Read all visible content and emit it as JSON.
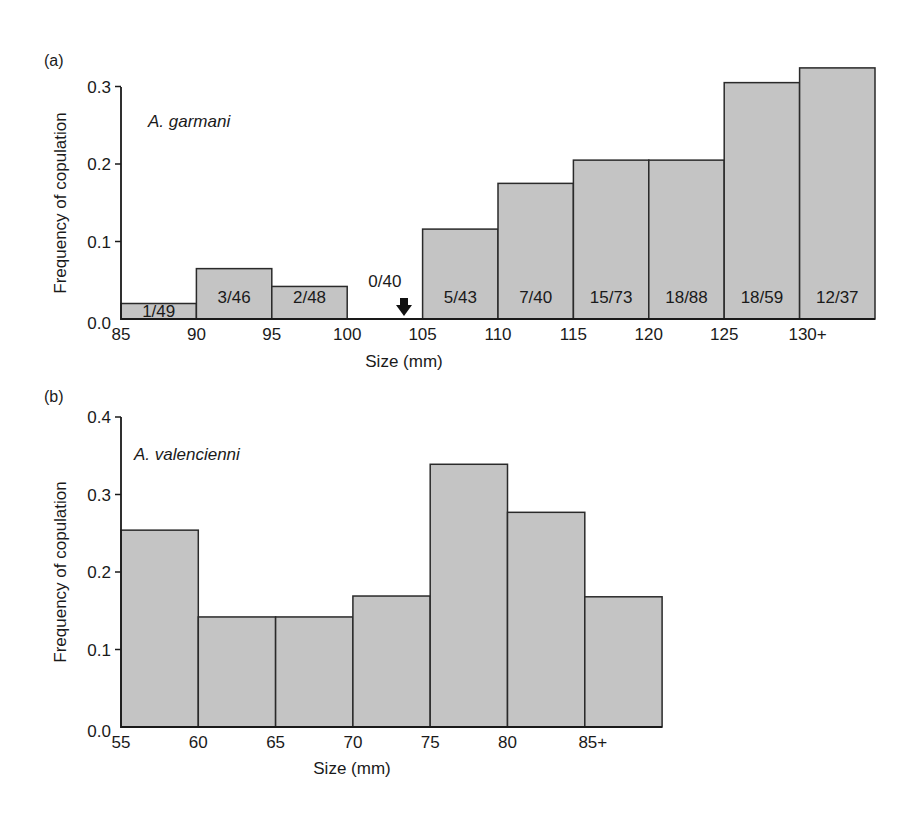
{
  "chart_data": [
    {
      "type": "bar",
      "panel": "(a)",
      "title": "A. garmani",
      "xlabel": "Size (mm)",
      "ylabel": "Frequency of copulation",
      "ylim": [
        0,
        0.3
      ],
      "yticks": [
        "0.0",
        "0.1",
        "0.2",
        "0.3"
      ],
      "categories": [
        "85",
        "90",
        "95",
        "100",
        "105",
        "110",
        "115",
        "120",
        "125",
        "130+"
      ],
      "values": [
        0.02,
        0.065,
        0.042,
        0.0,
        0.116,
        0.175,
        0.205,
        0.205,
        0.305,
        0.324
      ],
      "bar_labels": [
        "1/49",
        "3/46",
        "2/48",
        "0/40",
        "5/43",
        "7/40",
        "15/73",
        "18/88",
        "18/59",
        "12/37"
      ],
      "annotation": "arrow marking zero-height bin 100–105 (0/40)",
      "grid": false,
      "legend": null
    },
    {
      "type": "bar",
      "panel": "(b)",
      "title": "A. valencienni",
      "xlabel": "Size (mm)",
      "ylabel": "Frequency of copulation",
      "ylim": [
        0,
        0.4
      ],
      "yticks": [
        "0.0",
        "0.1",
        "0.2",
        "0.3",
        "0.4"
      ],
      "categories": [
        "55",
        "60",
        "65",
        "70",
        "75",
        "80",
        "85+"
      ],
      "values": [
        0.254,
        0.142,
        0.142,
        0.169,
        0.339,
        0.277,
        0.168
      ],
      "grid": false,
      "legend": null
    }
  ],
  "panels": {
    "a": {
      "label": "(a)",
      "species": "A. garmani",
      "ylabel": "Frequency of copulation",
      "xlabel": "Size (mm)",
      "yticks": [
        "0.0",
        "0.1",
        "0.2",
        "0.3"
      ],
      "xticks": [
        "85",
        "90",
        "95",
        "100",
        "105",
        "110",
        "115",
        "120",
        "125",
        "130+"
      ],
      "bar_labels": [
        "1/49",
        "3/46",
        "2/48",
        "0/40",
        "5/43",
        "7/40",
        "15/73",
        "18/88",
        "18/59",
        "12/37"
      ]
    },
    "b": {
      "label": "(b)",
      "species": "A. valencienni",
      "ylabel": "Frequency of copulation",
      "xlabel": "Size (mm)",
      "yticks": [
        "0.0",
        "0.1",
        "0.2",
        "0.3",
        "0.4"
      ],
      "xticks": [
        "55",
        "60",
        "65",
        "70",
        "75",
        "80",
        "85+"
      ]
    }
  },
  "colors": {
    "bar_fill": "#c4c4c4",
    "bar_stroke": "#2a2a2a",
    "axis": "#1a1a1a"
  }
}
